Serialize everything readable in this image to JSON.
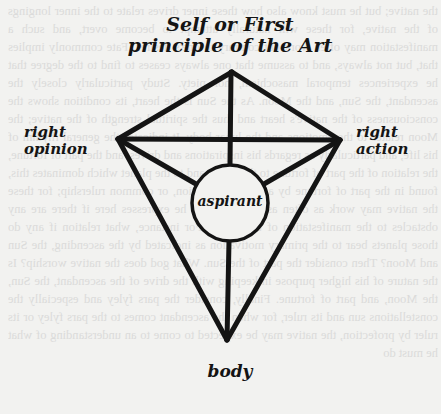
{
  "diagram": {
    "title_line1": "Self or First",
    "title_line2": "principle of the Art",
    "nodes": {
      "top": "Self or First principle of the Art",
      "left_line1": "right",
      "left_line2": "opinion",
      "right_line1": "right",
      "right_line2": "action",
      "center": "aspirant",
      "bottom": "body"
    },
    "edges": [
      [
        "top",
        "left"
      ],
      [
        "top",
        "right"
      ],
      [
        "top",
        "center"
      ],
      [
        "left",
        "right"
      ],
      [
        "left",
        "center"
      ],
      [
        "right",
        "center"
      ],
      [
        "left",
        "bottom"
      ],
      [
        "right",
        "bottom"
      ],
      [
        "center",
        "bottom"
      ]
    ],
    "colors": {
      "ink": "#141414",
      "paper": "#f2f2f0",
      "bleed_through": "#c9c9c9"
    }
  },
  "background": {
    "bleed_text": "the native; but he must know also how these inner drives relate to the inner longings of the native, for these will naturally attempt to become overt, and such a manifestation may often work out contrary to one's desires. Fate commonly implies that, but not always, and to assume that one always ceases to find to the degree that he experiences temporal masochism, nor piety. Study particularly closely the ascendant, the Sun, and the Moon. As the Sun is the heart, its condition shows the consciousness of the native's heart and thus the spiritual strength of the native; the Moon relates to the emotions and the lunar body. It indicates the general rhythm of his life, and particularly as regards his inspirations and drives, and the part of fortune, the relation of the part of fortune to the figure and to the planet which dominates this, found in the part of fortune by aspect, conjunction, or common rulership; for these the native may work as often as a trigger, and he expresses here if there are any obstacles to the manifestation of the drives. For instance, what relation if any do those planets bear to the primary motivation as indicated by the ascending, the Sun and Moon? Then consider the part of the Sun. What god does the native worship? Is the nature of his higher purpose in keeping with the drive of the ascendant, the Sun, the Moon, and part of fortune. Finally, consider the pars fyley and especially the constellations sun and its ruler, for when the ascendant comes to the pars fyley or its ruler by profection, the native may be expected to come to an understanding of what he must do"
  }
}
